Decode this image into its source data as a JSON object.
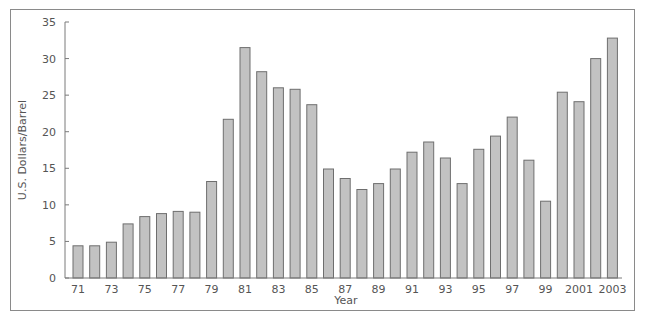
{
  "chart_data": {
    "type": "bar",
    "title": "",
    "xlabel": "Year",
    "ylabel": "U.S. Dollars/Barrel",
    "ylim": [
      0,
      35
    ],
    "yticks": [
      0,
      5,
      10,
      15,
      20,
      25,
      30,
      35
    ],
    "grid": false,
    "legend": "none",
    "categories": [
      "1971",
      "1972",
      "1973",
      "1974",
      "1975",
      "1976",
      "1977",
      "1978",
      "1979",
      "1980",
      "1981",
      "1982",
      "1983",
      "1984",
      "1985",
      "1986",
      "1987",
      "1988",
      "1989",
      "1990",
      "1991",
      "1992",
      "1993",
      "1994",
      "1995",
      "1996",
      "1997",
      "1998",
      "1999",
      "2000",
      "2001",
      "2002",
      "2003"
    ],
    "xtick_labels": [
      "71",
      "",
      "73",
      "",
      "75",
      "",
      "77",
      "",
      "79",
      "",
      "81",
      "",
      "83",
      "",
      "85",
      "",
      "87",
      "",
      "89",
      "",
      "91",
      "",
      "93",
      "",
      "95",
      "",
      "97",
      "",
      "99",
      "",
      "2001",
      "",
      "2003"
    ],
    "values": [
      4.4,
      4.4,
      4.9,
      7.4,
      8.4,
      8.8,
      9.1,
      9.0,
      13.2,
      21.7,
      31.5,
      28.2,
      26.0,
      25.8,
      23.7,
      14.9,
      13.6,
      12.1,
      12.9,
      14.9,
      17.2,
      18.6,
      16.4,
      12.9,
      17.6,
      19.4,
      22.0,
      16.1,
      10.5,
      25.4,
      24.1,
      30.0,
      32.8
    ],
    "colors": {
      "bar_fill": "#c2c2c2",
      "bar_stroke": "#6e6e6e",
      "axis": "#7a7a7a",
      "text": "#555555"
    }
  }
}
